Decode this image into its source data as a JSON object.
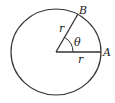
{
  "diagram": {
    "type": "circle-radian-definition",
    "labels": {
      "point_b": "B",
      "point_a": "A",
      "radius_upper": "r",
      "radius_lower": "r",
      "angle": "θ"
    },
    "colors": {
      "stroke": "#333333",
      "background": "#ffffff"
    }
  }
}
